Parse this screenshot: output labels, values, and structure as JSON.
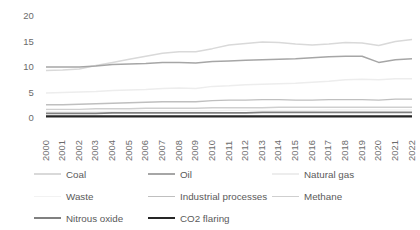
{
  "chart_data": {
    "type": "line",
    "title": "",
    "xlabel": "",
    "ylabel": "",
    "ylim": [
      0,
      20
    ],
    "yticks": [
      0,
      5,
      10,
      15,
      20
    ],
    "grid": false,
    "legend_position": "bottom",
    "categories": [
      "2000",
      "2001",
      "2002",
      "2003",
      "2004",
      "2005",
      "2006",
      "2007",
      "2008",
      "2009",
      "2010",
      "2011",
      "2012",
      "2013",
      "2014",
      "2015",
      "2016",
      "2017",
      "2018",
      "2019",
      "2020",
      "2021",
      "2022"
    ],
    "series": [
      {
        "name": "Coal",
        "color": "#d9d9d9",
        "width": 1.5,
        "values": [
          9.3,
          9.4,
          9.6,
          10.3,
          10.9,
          11.5,
          12.1,
          12.7,
          13.0,
          13.0,
          13.6,
          14.3,
          14.6,
          14.9,
          14.8,
          14.5,
          14.3,
          14.5,
          14.8,
          14.7,
          14.2,
          15.0,
          15.4
        ]
      },
      {
        "name": "Oil",
        "color": "#a6a6a6",
        "width": 1.5,
        "values": [
          10.0,
          10.0,
          10.0,
          10.2,
          10.5,
          10.6,
          10.7,
          10.9,
          10.9,
          10.8,
          11.1,
          11.2,
          11.3,
          11.4,
          11.5,
          11.6,
          11.8,
          12.0,
          12.1,
          12.1,
          10.9,
          11.4,
          11.6
        ]
      },
      {
        "name": "Natural gas",
        "color": "#ededed",
        "width": 1.5,
        "values": [
          4.9,
          5.0,
          5.1,
          5.2,
          5.4,
          5.5,
          5.6,
          5.8,
          5.9,
          5.8,
          6.2,
          6.3,
          6.5,
          6.6,
          6.7,
          6.8,
          7.0,
          7.2,
          7.5,
          7.6,
          7.5,
          7.7,
          7.7
        ]
      },
      {
        "name": "Waste",
        "color": "#f2f2f2",
        "width": 1.2,
        "values": [
          1.3,
          1.3,
          1.3,
          1.3,
          1.3,
          1.4,
          1.4,
          1.4,
          1.4,
          1.4,
          1.4,
          1.5,
          1.5,
          1.5,
          1.5,
          1.5,
          1.5,
          1.6,
          1.6,
          1.6,
          1.6,
          1.6,
          1.6
        ]
      },
      {
        "name": "Industrial processes",
        "color": "#bfbfbf",
        "width": 1.4,
        "values": [
          2.6,
          2.6,
          2.7,
          2.8,
          2.9,
          3.0,
          3.1,
          3.2,
          3.2,
          3.2,
          3.4,
          3.5,
          3.5,
          3.6,
          3.6,
          3.5,
          3.5,
          3.6,
          3.6,
          3.6,
          3.5,
          3.7,
          3.7
        ]
      },
      {
        "name": "Methane",
        "color": "#cfcfcf",
        "width": 1.4,
        "values": [
          1.7,
          1.7,
          1.7,
          1.8,
          1.8,
          1.8,
          1.9,
          1.9,
          1.9,
          1.9,
          2.0,
          2.0,
          2.0,
          2.0,
          2.1,
          2.1,
          2.1,
          2.1,
          2.1,
          2.1,
          2.1,
          2.1,
          2.1
        ]
      },
      {
        "name": "Nitrous oxide",
        "color": "#808080",
        "width": 1.6,
        "values": [
          0.9,
          0.9,
          0.9,
          0.9,
          1.0,
          1.0,
          1.0,
          1.0,
          1.0,
          1.0,
          1.0,
          1.0,
          1.0,
          1.1,
          1.1,
          1.1,
          1.1,
          1.1,
          1.1,
          1.1,
          1.1,
          1.1,
          1.1
        ]
      },
      {
        "name": "CO2 flaring",
        "color": "#262626",
        "width": 2.2,
        "values": [
          0.3,
          0.3,
          0.3,
          0.3,
          0.3,
          0.3,
          0.3,
          0.3,
          0.3,
          0.3,
          0.3,
          0.3,
          0.3,
          0.3,
          0.3,
          0.3,
          0.3,
          0.3,
          0.3,
          0.3,
          0.3,
          0.3,
          0.3
        ]
      }
    ]
  },
  "legend": {
    "rows": [
      [
        {
          "label": "Coal",
          "series": 0
        },
        {
          "label": "Oil",
          "series": 1
        },
        {
          "label": "Natural gas",
          "series": 2
        }
      ],
      [
        {
          "label": "Waste",
          "series": 3
        },
        {
          "label": "Industrial processes",
          "series": 4
        },
        {
          "label": "Methane",
          "series": 5
        }
      ],
      [
        {
          "label": "Nitrous oxide",
          "series": 6
        },
        {
          "label": "CO2 flaring",
          "series": 7
        }
      ]
    ]
  }
}
